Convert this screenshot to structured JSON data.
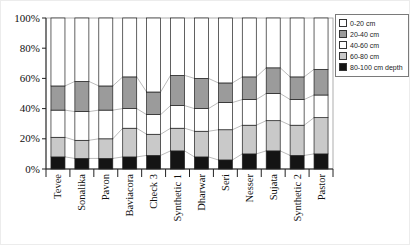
{
  "chart_data": {
    "type": "bar",
    "variant": "100%-stacked-column-with-series-lines",
    "title": "",
    "xlabel": "",
    "ylabel": "",
    "ylim": [
      0,
      100
    ],
    "y_tick_labels": [
      "0%",
      "20%",
      "40%",
      "60%",
      "80%",
      "100%"
    ],
    "legend_position": "right",
    "grid": false,
    "categories": [
      "Tevee",
      "Sonalika",
      "Pavon",
      "Baviacora",
      "Check 3",
      "Synthetic 1",
      "Dharwar",
      "Seri",
      "Nesser",
      "Sujata",
      "Synthetic 2",
      "Pastor"
    ],
    "series": [
      {
        "name": "0-20 cm",
        "color": "#ffffff",
        "values": [
          45,
          42,
          45,
          39,
          49,
          38,
          40,
          43,
          39,
          33,
          39,
          34
        ]
      },
      {
        "name": "20-40 cm",
        "color": "#9b9b9b",
        "values": [
          16,
          20,
          16,
          21,
          15,
          20,
          20,
          13,
          15,
          17,
          15,
          17
        ]
      },
      {
        "name": "40-60 cm",
        "color": "#ffffff",
        "values": [
          18,
          19,
          19,
          13,
          13,
          15,
          15,
          18,
          17,
          18,
          17,
          15
        ]
      },
      {
        "name": "60-80 cm",
        "color": "#c9c9c9",
        "values": [
          13,
          12,
          13,
          19,
          14,
          15,
          17,
          20,
          19,
          20,
          20,
          24
        ]
      },
      {
        "name": "80-100 cm depth",
        "color": "#141414",
        "values": [
          8,
          7,
          7,
          8,
          9,
          12,
          8,
          6,
          10,
          12,
          9,
          10
        ]
      }
    ],
    "stack_bottom_to_top": [
      "80-100 cm depth",
      "60-80 cm",
      "40-60 cm",
      "20-40 cm",
      "0-20 cm"
    ],
    "colors": {
      "bar_border": "#1f1f1f",
      "series_line": "#a9a9a9",
      "axis": "#222222",
      "plot_border": "#9a9a9a"
    }
  }
}
